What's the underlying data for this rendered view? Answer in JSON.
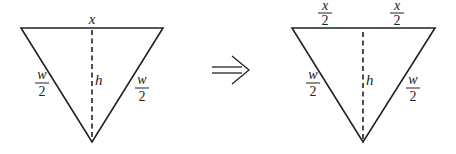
{
  "diagram": {
    "colors": {
      "stroke": "#222222",
      "background": "#ffffff"
    },
    "left_triangle": {
      "vertices": {
        "top_left": [
          21,
          28
        ],
        "top_right": [
          163,
          28
        ],
        "bottom": [
          92,
          142
        ]
      },
      "top_label": "x",
      "height_label": "h",
      "left_side_label": {
        "numerator": "w",
        "denominator": "2"
      },
      "right_side_label": {
        "numerator": "w",
        "denominator": "2"
      }
    },
    "arrow": {
      "symbol": "⟹",
      "meaning": "implies"
    },
    "right_triangle": {
      "vertices": {
        "top_left": [
          292,
          28
        ],
        "top_right": [
          435,
          28
        ],
        "bottom": [
          363,
          142
        ]
      },
      "top_left_label": {
        "numerator": "x",
        "denominator": "2"
      },
      "top_right_label": {
        "numerator": "x",
        "denominator": "2"
      },
      "height_label": "h",
      "left_side_label": {
        "numerator": "w",
        "denominator": "2"
      },
      "right_side_label": {
        "numerator": "w",
        "denominator": "2"
      }
    }
  }
}
